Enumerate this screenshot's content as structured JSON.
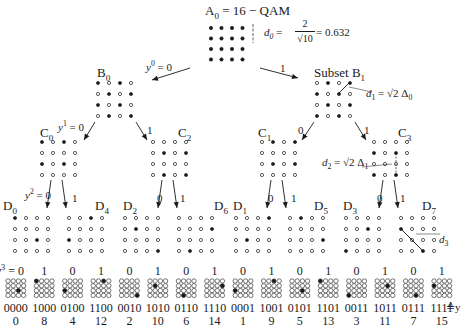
{
  "title": {
    "a0": "A",
    "a0_sub": "0",
    "a0_rest": " = 16 − QAM",
    "d0_label": "d",
    "d0_sub": "0",
    "d0_eq": " = ",
    "d0_num": "2",
    "d0_den": "√10",
    "d0_val": " = 0.632"
  },
  "level1": {
    "left_label": "B",
    "left_sub": "0",
    "right_label": "Subset B",
    "right_sub": "1",
    "branch_left": "y",
    "branch_left_sup": "0",
    "branch_left_val": " = 0",
    "branch_right": "1",
    "d1_label": "d",
    "d1_sub": "1",
    "d1_rest": " = √2 Δ",
    "d1_rest_sub": "0"
  },
  "level2": {
    "labels": [
      {
        "name": "C",
        "sub": "0"
      },
      {
        "name": "C",
        "sub": "2"
      },
      {
        "name": "C",
        "sub": "1"
      },
      {
        "name": "C",
        "sub": "3"
      }
    ],
    "branch_b0_left": "y",
    "branch_b0_left_sup": "1",
    "branch_b0_left_val": " = 0",
    "branch_b0_right": "1",
    "branch_b1_left": "0",
    "branch_b1_right": "1",
    "d2_label": "d",
    "d2_sub": "2",
    "d2_rest": " = √2 Δ",
    "d2_rest_sub": "1"
  },
  "level3": {
    "labels": [
      {
        "name": "D",
        "sub": "0"
      },
      {
        "name": "D",
        "sub": "4"
      },
      {
        "name": "D",
        "sub": "2"
      },
      {
        "name": "D",
        "sub": "6"
      },
      {
        "name": "D",
        "sub": "1"
      },
      {
        "name": "D",
        "sub": "5"
      },
      {
        "name": "D",
        "sub": "3"
      },
      {
        "name": "D",
        "sub": "7"
      }
    ],
    "branch_first_left": "y",
    "branch_first_left_sup": "2",
    "branch_first_left_val": " = 0",
    "branch_zero": "0",
    "branch_one": "1",
    "d3_label": "d",
    "d3_sub": "3"
  },
  "leaves": {
    "y3_prefix": "y",
    "y3_sup": "3",
    "y3_eq": " = ",
    "bit_labels": [
      "0",
      "1",
      "0",
      "1",
      "0",
      "1",
      "0",
      "1",
      "0",
      "1",
      "0",
      "1",
      "0",
      "1",
      "0",
      "1"
    ],
    "codes": [
      "0000",
      "1000",
      "0100",
      "1100",
      "0010",
      "1010",
      "0110",
      "1110",
      "0001",
      "1001",
      "0101",
      "1101",
      "0011",
      "1011",
      "0111",
      "1111"
    ],
    "indices": [
      "0",
      "8",
      "4",
      "12",
      "2",
      "10",
      "6",
      "14",
      "1",
      "9",
      "5",
      "13",
      "3",
      "11",
      "7",
      "15"
    ],
    "def_symbol": "≙y"
  },
  "colors": {
    "ink": "#1a1a1a",
    "background": "#ffffff"
  }
}
